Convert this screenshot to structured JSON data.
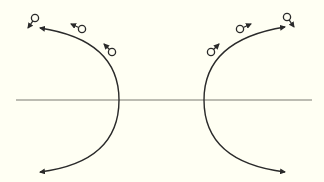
{
  "diagram": {
    "background": "#fffff3",
    "stroke_color": "#2a2a2a",
    "axis_color": "#7a7a72",
    "axis_line": {
      "x1": 16,
      "y1": 100,
      "x2": 312,
      "y2": 100
    },
    "arcs": [
      {
        "name": "left-trajectory",
        "path": "M40 28 Q119 40 119 100 Q119 162 40 172",
        "start_arrow": "left",
        "end_arrow": "left"
      },
      {
        "name": "right-trajectory",
        "path": "M285 27 Q204 40 204 100 Q204 162 285 172",
        "start_arrow": "right",
        "end_arrow": "right"
      }
    ],
    "particles": [
      {
        "side": "left",
        "cx": 35,
        "cy": 18,
        "vx": -7,
        "vy": 10
      },
      {
        "side": "left",
        "cx": 82,
        "cy": 29,
        "vx": -11,
        "vy": -5
      },
      {
        "side": "left",
        "cx": 112,
        "cy": 52,
        "vx": -8,
        "vy": -8
      },
      {
        "side": "right",
        "cx": 211,
        "cy": 52,
        "vx": 8,
        "vy": -8
      },
      {
        "side": "right",
        "cx": 240,
        "cy": 29,
        "vx": 11,
        "vy": -5
      },
      {
        "side": "right",
        "cx": 287,
        "cy": 17,
        "vx": 7,
        "vy": 10
      }
    ]
  }
}
